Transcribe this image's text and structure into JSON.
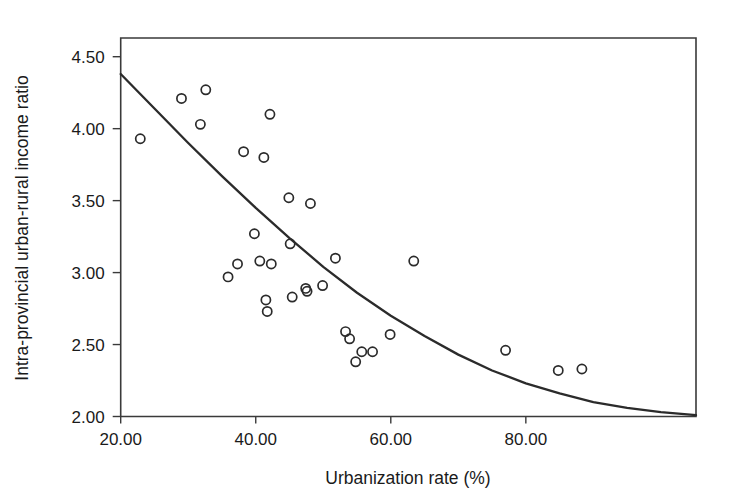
{
  "chart_data": {
    "type": "scatter",
    "title": "",
    "xlabel": "Urbanization rate (%)",
    "ylabel": "Intra-provincial urban-rural income ratio",
    "xlim": [
      20.0,
      105.2
    ],
    "ylim": [
      2.0,
      4.63
    ],
    "xticks": [
      20,
      40,
      60,
      80
    ],
    "xticklabels": [
      "20.00",
      "40.00",
      "60.00",
      "80.00"
    ],
    "yticks": [
      2.0,
      2.5,
      3.0,
      3.5,
      4.0,
      4.5
    ],
    "yticklabels": [
      "2.00",
      "2.50",
      "3.00",
      "3.50",
      "4.00",
      "4.50"
    ],
    "grid": false,
    "legend": null,
    "marker": "open-circle",
    "marker_color": "#2b2b2b",
    "x": [
      22.9,
      29.0,
      31.8,
      32.6,
      35.9,
      37.3,
      38.2,
      39.8,
      40.6,
      41.2,
      41.5,
      41.7,
      42.1,
      42.3,
      44.9,
      45.1,
      45.3,
      45.4,
      47.4,
      47.6,
      48.1,
      49.9,
      50.1,
      51.8,
      53.3,
      53.9,
      54.8,
      55.7,
      57.3,
      59.9,
      63.4,
      77.0,
      84.8,
      88.3
    ],
    "y": [
      3.93,
      4.21,
      4.03,
      4.27,
      2.97,
      3.06,
      3.84,
      3.27,
      3.08,
      3.8,
      2.81,
      2.73,
      4.1,
      3.06,
      3.52,
      3.2,
      2.83,
      2.83,
      2.89,
      2.87,
      3.48,
      2.91,
      3.48,
      3.1,
      2.59,
      2.54,
      2.38,
      2.45,
      2.45,
      2.57,
      3.08,
      2.46,
      2.32,
      2.33
    ],
    "points": [
      {
        "x": 22.9,
        "y": 3.93
      },
      {
        "x": 29.0,
        "y": 4.21
      },
      {
        "x": 31.8,
        "y": 4.03
      },
      {
        "x": 32.6,
        "y": 4.27
      },
      {
        "x": 35.9,
        "y": 2.97
      },
      {
        "x": 37.3,
        "y": 3.06
      },
      {
        "x": 38.2,
        "y": 3.84
      },
      {
        "x": 39.8,
        "y": 3.27
      },
      {
        "x": 40.6,
        "y": 3.08
      },
      {
        "x": 41.2,
        "y": 3.8
      },
      {
        "x": 41.5,
        "y": 2.81
      },
      {
        "x": 41.7,
        "y": 2.73
      },
      {
        "x": 42.1,
        "y": 4.1
      },
      {
        "x": 42.3,
        "y": 3.06
      },
      {
        "x": 44.9,
        "y": 3.52
      },
      {
        "x": 45.1,
        "y": 3.2
      },
      {
        "x": 45.4,
        "y": 2.83
      },
      {
        "x": 47.4,
        "y": 2.89
      },
      {
        "x": 47.6,
        "y": 2.87
      },
      {
        "x": 48.1,
        "y": 3.48
      },
      {
        "x": 49.9,
        "y": 2.91
      },
      {
        "x": 51.8,
        "y": 3.1
      },
      {
        "x": 53.3,
        "y": 2.59
      },
      {
        "x": 53.9,
        "y": 2.54
      },
      {
        "x": 54.8,
        "y": 2.38
      },
      {
        "x": 55.7,
        "y": 2.45
      },
      {
        "x": 57.3,
        "y": 2.45
      },
      {
        "x": 59.9,
        "y": 2.57
      },
      {
        "x": 63.4,
        "y": 3.08
      },
      {
        "x": 77.0,
        "y": 2.46
      },
      {
        "x": 84.8,
        "y": 2.32
      },
      {
        "x": 88.3,
        "y": 2.33
      }
    ],
    "fit_curve": {
      "name": "fitted-trend-curve",
      "type": "exponential-decay",
      "points": [
        {
          "x": 20.0,
          "y": 4.38
        },
        {
          "x": 25.0,
          "y": 4.14
        },
        {
          "x": 30.0,
          "y": 3.9
        },
        {
          "x": 35.0,
          "y": 3.67
        },
        {
          "x": 40.0,
          "y": 3.45
        },
        {
          "x": 45.0,
          "y": 3.24
        },
        {
          "x": 50.0,
          "y": 3.04
        },
        {
          "x": 55.0,
          "y": 2.86
        },
        {
          "x": 60.0,
          "y": 2.7
        },
        {
          "x": 65.0,
          "y": 2.56
        },
        {
          "x": 70.0,
          "y": 2.43
        },
        {
          "x": 75.0,
          "y": 2.32
        },
        {
          "x": 80.0,
          "y": 2.23
        },
        {
          "x": 85.0,
          "y": 2.16
        },
        {
          "x": 90.0,
          "y": 2.1
        },
        {
          "x": 95.0,
          "y": 2.06
        },
        {
          "x": 100.0,
          "y": 2.03
        },
        {
          "x": 105.2,
          "y": 2.01
        }
      ]
    }
  }
}
